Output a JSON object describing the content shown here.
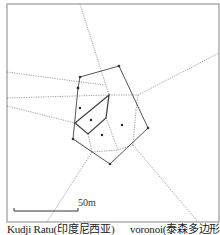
{
  "figure": {
    "site_name": "Kudji Ratu(印度尼西亚)",
    "method_label": "voronoi(泰森多边形)",
    "scale_bar": {
      "label": "50m"
    }
  },
  "diagram": {
    "frame": {
      "x": 7,
      "y": 4,
      "width": 212,
      "height": 218,
      "stroke": "#9a9a9a"
    },
    "outer_polygon": {
      "stroke": "#555555",
      "points": [
        [
          80,
          77
        ],
        [
          119,
          66
        ],
        [
          148,
          128
        ],
        [
          110,
          164
        ],
        [
          73,
          139
        ],
        [
          78,
          88
        ]
      ]
    },
    "inner_polygon": {
      "stroke": "#444444",
      "points": [
        [
          109,
          95
        ],
        [
          106,
          118
        ],
        [
          88,
          134
        ],
        [
          75,
          123
        ]
      ]
    },
    "sites": [
      [
        80,
        108
      ],
      [
        91,
        120
      ],
      [
        102,
        135
      ],
      [
        122,
        125
      ],
      [
        78,
        88
      ]
    ],
    "voronoi_edges": [
      [
        [
          80,
          4
        ],
        [
          109,
          95
        ]
      ],
      [
        [
          7,
          72
        ],
        [
          104,
          85
        ]
      ],
      [
        [
          7,
          98
        ],
        [
          109,
          95
        ]
      ],
      [
        [
          109,
          95
        ],
        [
          138,
          95
        ]
      ],
      [
        [
          138,
          95
        ],
        [
          219,
          53
        ]
      ],
      [
        [
          7,
          106
        ],
        [
          75,
          123
        ]
      ],
      [
        [
          106,
          118
        ],
        [
          118,
          150
        ]
      ],
      [
        [
          118,
          150
        ],
        [
          133,
          145
        ]
      ],
      [
        [
          88,
          134
        ],
        [
          92,
          152
        ]
      ],
      [
        [
          92,
          152
        ],
        [
          118,
          150
        ]
      ],
      [
        [
          92,
          152
        ],
        [
          47,
          222
        ]
      ],
      [
        [
          133,
          145
        ],
        [
          198,
          222
        ]
      ],
      [
        [
          138,
          95
        ],
        [
          136,
          110
        ]
      ],
      [
        [
          136,
          110
        ],
        [
          133,
          145
        ]
      ],
      [
        [
          76,
          140
        ],
        [
          92,
          152
        ]
      ]
    ],
    "scale_bar": {
      "x1": 14,
      "x2": 78,
      "y": 211
    }
  }
}
